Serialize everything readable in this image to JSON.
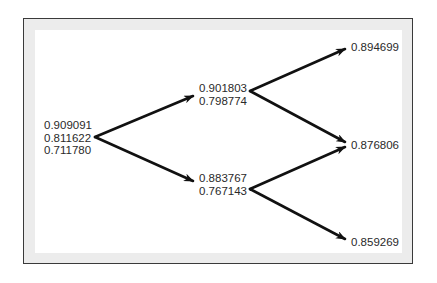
{
  "diagram": {
    "type": "binomial-tree",
    "root": {
      "values": [
        "0.909091",
        "0.811622",
        "0.711780"
      ]
    },
    "level1": {
      "up": {
        "values": [
          "0.901803",
          "0.798774"
        ]
      },
      "down": {
        "values": [
          "0.883767",
          "0.767143"
        ]
      }
    },
    "level2": {
      "upup": {
        "values": [
          "0.894699"
        ]
      },
      "middle": {
        "values": [
          "0.876806"
        ]
      },
      "downdown": {
        "values": [
          "0.859269"
        ]
      }
    },
    "colors": {
      "arrow": "#111111",
      "frame_border": "#3a3a3a",
      "frame_band": "#ececec",
      "text": "#2a2a2a"
    }
  }
}
